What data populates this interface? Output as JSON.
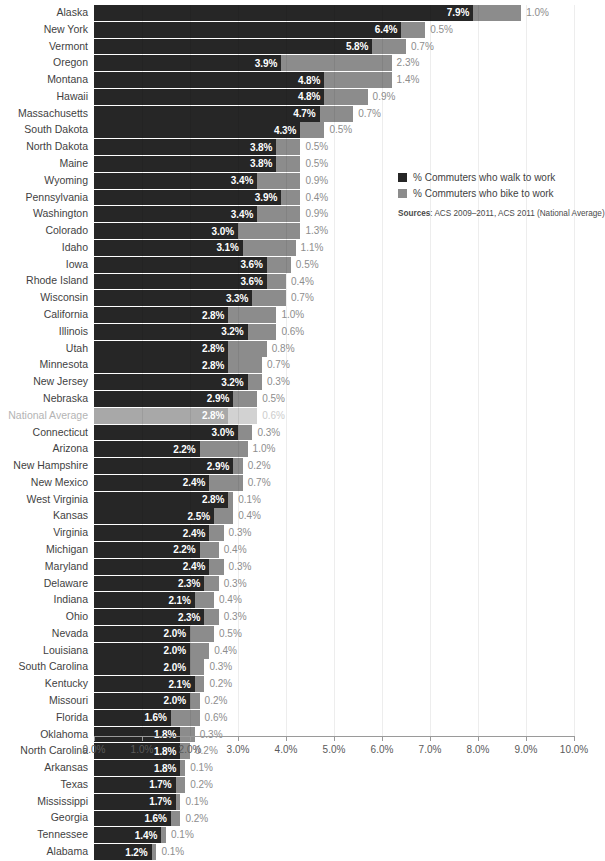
{
  "chart_data": {
    "type": "bar",
    "orientation": "horizontal",
    "stacked": true,
    "title": "",
    "subtitle": "",
    "xlabel": "",
    "ylabel": "",
    "xlim": [
      0,
      10
    ],
    "xtick_labels": [
      "0.0%",
      "1.0%",
      "2.0%",
      "3.0%",
      "4.0%",
      "5.0%",
      "6.0%",
      "7.0%",
      "8.0%",
      "9.0%",
      "10.0%"
    ],
    "xtick_values": [
      0,
      1,
      2,
      3,
      4,
      5,
      6,
      7,
      8,
      9,
      10
    ],
    "grid": true,
    "legend_position": "right",
    "series": [
      {
        "name": "% Commuters who walk to work",
        "color": "#262626"
      },
      {
        "name": "% Commuters who bike to work",
        "color": "#8c8c8c"
      }
    ],
    "categories": [
      "Alaska",
      "New York",
      "Vermont",
      "Oregon",
      "Montana",
      "Hawaii",
      "Massachusetts",
      "South Dakota",
      "North Dakota",
      "Maine",
      "Wyoming",
      "Pennsylvania",
      "Washington",
      "Colorado",
      "Idaho",
      "Iowa",
      "Rhode Island",
      "Wisconsin",
      "California",
      "Illinois",
      "Utah",
      "Minnesota",
      "New Jersey",
      "Nebraska",
      "National Average",
      "Connecticut",
      "Arizona",
      "New Hampshire",
      "New Mexico",
      "West Virginia",
      "Kansas",
      "Virginia",
      "Michigan",
      "Maryland",
      "Delaware",
      "Indiana",
      "Ohio",
      "Nevada",
      "Louisiana",
      "South Carolina",
      "Kentucky",
      "Missouri",
      "Florida",
      "Oklahoma",
      "North Carolina",
      "Arkansas",
      "Texas",
      "Mississippi",
      "Georgia",
      "Tennessee",
      "Alabama"
    ],
    "walk_values": [
      7.9,
      6.4,
      5.8,
      3.9,
      4.8,
      4.8,
      4.7,
      4.3,
      3.8,
      3.8,
      3.4,
      3.9,
      3.4,
      3.0,
      3.1,
      3.6,
      3.6,
      3.3,
      2.8,
      3.2,
      2.8,
      2.8,
      3.2,
      2.9,
      2.8,
      3.0,
      2.2,
      2.9,
      2.4,
      2.8,
      2.5,
      2.4,
      2.2,
      2.4,
      2.3,
      2.1,
      2.3,
      2.0,
      2.0,
      2.0,
      2.1,
      2.0,
      1.6,
      1.8,
      1.8,
      1.8,
      1.7,
      1.7,
      1.6,
      1.4,
      1.2
    ],
    "bike_values": [
      1.0,
      0.5,
      0.7,
      2.3,
      1.4,
      0.9,
      0.7,
      0.5,
      0.5,
      0.5,
      0.9,
      0.4,
      0.9,
      1.3,
      1.1,
      0.5,
      0.4,
      0.7,
      1.0,
      0.6,
      0.8,
      0.7,
      0.3,
      0.5,
      0.6,
      0.3,
      1.0,
      0.2,
      0.7,
      0.1,
      0.4,
      0.3,
      0.4,
      0.3,
      0.3,
      0.4,
      0.3,
      0.5,
      0.4,
      0.3,
      0.2,
      0.2,
      0.6,
      0.3,
      0.2,
      0.1,
      0.2,
      0.1,
      0.2,
      0.1,
      0.1
    ],
    "highlight_row": "National Average"
  },
  "rows": [
    {
      "label": "Alaska",
      "walk": "7.9%",
      "bike": "1.0%",
      "walk_v": 7.9,
      "bike_v": 1.0,
      "avg": false
    },
    {
      "label": "New York",
      "walk": "6.4%",
      "bike": "0.5%",
      "walk_v": 6.4,
      "bike_v": 0.5,
      "avg": false
    },
    {
      "label": "Vermont",
      "walk": "5.8%",
      "bike": "0.7%",
      "walk_v": 5.8,
      "bike_v": 0.7,
      "avg": false
    },
    {
      "label": "Oregon",
      "walk": "3.9%",
      "bike": "2.3%",
      "walk_v": 3.9,
      "bike_v": 2.3,
      "avg": false
    },
    {
      "label": "Montana",
      "walk": "4.8%",
      "bike": "1.4%",
      "walk_v": 4.8,
      "bike_v": 1.4,
      "avg": false
    },
    {
      "label": "Hawaii",
      "walk": "4.8%",
      "bike": "0.9%",
      "walk_v": 4.8,
      "bike_v": 0.9,
      "avg": false
    },
    {
      "label": "Massachusetts",
      "walk": "4.7%",
      "bike": "0.7%",
      "walk_v": 4.7,
      "bike_v": 0.7,
      "avg": false
    },
    {
      "label": "South Dakota",
      "walk": "4.3%",
      "bike": "0.5%",
      "walk_v": 4.3,
      "bike_v": 0.5,
      "avg": false
    },
    {
      "label": "North Dakota",
      "walk": "3.8%",
      "bike": "0.5%",
      "walk_v": 3.8,
      "bike_v": 0.5,
      "avg": false
    },
    {
      "label": "Maine",
      "walk": "3.8%",
      "bike": "0.5%",
      "walk_v": 3.8,
      "bike_v": 0.5,
      "avg": false
    },
    {
      "label": "Wyoming",
      "walk": "3.4%",
      "bike": "0.9%",
      "walk_v": 3.4,
      "bike_v": 0.9,
      "avg": false
    },
    {
      "label": "Pennsylvania",
      "walk": "3.9%",
      "bike": "0.4%",
      "walk_v": 3.9,
      "bike_v": 0.4,
      "avg": false
    },
    {
      "label": "Washington",
      "walk": "3.4%",
      "bike": "0.9%",
      "walk_v": 3.4,
      "bike_v": 0.9,
      "avg": false
    },
    {
      "label": "Colorado",
      "walk": "3.0%",
      "bike": "1.3%",
      "walk_v": 3.0,
      "bike_v": 1.3,
      "avg": false
    },
    {
      "label": "Idaho",
      "walk": "3.1%",
      "bike": "1.1%",
      "walk_v": 3.1,
      "bike_v": 1.1,
      "avg": false
    },
    {
      "label": "Iowa",
      "walk": "3.6%",
      "bike": "0.5%",
      "walk_v": 3.6,
      "bike_v": 0.5,
      "avg": false
    },
    {
      "label": "Rhode Island",
      "walk": "3.6%",
      "bike": "0.4%",
      "walk_v": 3.6,
      "bike_v": 0.4,
      "avg": false
    },
    {
      "label": "Wisconsin",
      "walk": "3.3%",
      "bike": "0.7%",
      "walk_v": 3.3,
      "bike_v": 0.7,
      "avg": false
    },
    {
      "label": "California",
      "walk": "2.8%",
      "bike": "1.0%",
      "walk_v": 2.8,
      "bike_v": 1.0,
      "avg": false
    },
    {
      "label": "Illinois",
      "walk": "3.2%",
      "bike": "0.6%",
      "walk_v": 3.2,
      "bike_v": 0.6,
      "avg": false
    },
    {
      "label": "Utah",
      "walk": "2.8%",
      "bike": "0.8%",
      "walk_v": 2.8,
      "bike_v": 0.8,
      "avg": false
    },
    {
      "label": "Minnesota",
      "walk": "2.8%",
      "bike": "0.7%",
      "walk_v": 2.8,
      "bike_v": 0.7,
      "avg": false
    },
    {
      "label": "New Jersey",
      "walk": "3.2%",
      "bike": "0.3%",
      "walk_v": 3.2,
      "bike_v": 0.3,
      "avg": false
    },
    {
      "label": "Nebraska",
      "walk": "2.9%",
      "bike": "0.5%",
      "walk_v": 2.9,
      "bike_v": 0.5,
      "avg": false
    },
    {
      "label": "National Average",
      "walk": "2.8%",
      "bike": "0.6%",
      "walk_v": 2.8,
      "bike_v": 0.6,
      "avg": true
    },
    {
      "label": "Connecticut",
      "walk": "3.0%",
      "bike": "0.3%",
      "walk_v": 3.0,
      "bike_v": 0.3,
      "avg": false
    },
    {
      "label": "Arizona",
      "walk": "2.2%",
      "bike": "1.0%",
      "walk_v": 2.2,
      "bike_v": 1.0,
      "avg": false
    },
    {
      "label": "New Hampshire",
      "walk": "2.9%",
      "bike": "0.2%",
      "walk_v": 2.9,
      "bike_v": 0.2,
      "avg": false
    },
    {
      "label": "New Mexico",
      "walk": "2.4%",
      "bike": "0.7%",
      "walk_v": 2.4,
      "bike_v": 0.7,
      "avg": false
    },
    {
      "label": "West Virginia",
      "walk": "2.8%",
      "bike": "0.1%",
      "walk_v": 2.8,
      "bike_v": 0.1,
      "avg": false
    },
    {
      "label": "Kansas",
      "walk": "2.5%",
      "bike": "0.4%",
      "walk_v": 2.5,
      "bike_v": 0.4,
      "avg": false
    },
    {
      "label": "Virginia",
      "walk": "2.4%",
      "bike": "0.3%",
      "walk_v": 2.4,
      "bike_v": 0.3,
      "avg": false
    },
    {
      "label": "Michigan",
      "walk": "2.2%",
      "bike": "0.4%",
      "walk_v": 2.2,
      "bike_v": 0.4,
      "avg": false
    },
    {
      "label": "Maryland",
      "walk": "2.4%",
      "bike": "0.3%",
      "walk_v": 2.4,
      "bike_v": 0.3,
      "avg": false
    },
    {
      "label": "Delaware",
      "walk": "2.3%",
      "bike": "0.3%",
      "walk_v": 2.3,
      "bike_v": 0.3,
      "avg": false
    },
    {
      "label": "Indiana",
      "walk": "2.1%",
      "bike": "0.4%",
      "walk_v": 2.1,
      "bike_v": 0.4,
      "avg": false
    },
    {
      "label": "Ohio",
      "walk": "2.3%",
      "bike": "0.3%",
      "walk_v": 2.3,
      "bike_v": 0.3,
      "avg": false
    },
    {
      "label": "Nevada",
      "walk": "2.0%",
      "bike": "0.5%",
      "walk_v": 2.0,
      "bike_v": 0.5,
      "avg": false
    },
    {
      "label": "Louisiana",
      "walk": "2.0%",
      "bike": "0.4%",
      "walk_v": 2.0,
      "bike_v": 0.4,
      "avg": false
    },
    {
      "label": "South Carolina",
      "walk": "2.0%",
      "bike": "0.3%",
      "walk_v": 2.0,
      "bike_v": 0.3,
      "avg": false
    },
    {
      "label": "Kentucky",
      "walk": "2.1%",
      "bike": "0.2%",
      "walk_v": 2.1,
      "bike_v": 0.2,
      "avg": false
    },
    {
      "label": "Missouri",
      "walk": "2.0%",
      "bike": "0.2%",
      "walk_v": 2.0,
      "bike_v": 0.2,
      "avg": false
    },
    {
      "label": "Florida",
      "walk": "1.6%",
      "bike": "0.6%",
      "walk_v": 1.6,
      "bike_v": 0.6,
      "avg": false
    },
    {
      "label": "Oklahoma",
      "walk": "1.8%",
      "bike": "0.3%",
      "walk_v": 1.8,
      "bike_v": 0.3,
      "avg": false
    },
    {
      "label": "North Carolina",
      "walk": "1.8%",
      "bike": "0.2%",
      "walk_v": 1.8,
      "bike_v": 0.2,
      "avg": false
    },
    {
      "label": "Arkansas",
      "walk": "1.8%",
      "bike": "0.1%",
      "walk_v": 1.8,
      "bike_v": 0.1,
      "avg": false
    },
    {
      "label": "Texas",
      "walk": "1.7%",
      "bike": "0.2%",
      "walk_v": 1.7,
      "bike_v": 0.2,
      "avg": false
    },
    {
      "label": "Mississippi",
      "walk": "1.7%",
      "bike": "0.1%",
      "walk_v": 1.7,
      "bike_v": 0.1,
      "avg": false
    },
    {
      "label": "Georgia",
      "walk": "1.6%",
      "bike": "0.2%",
      "walk_v": 1.6,
      "bike_v": 0.2,
      "avg": false
    },
    {
      "label": "Tennessee",
      "walk": "1.4%",
      "bike": "0.1%",
      "walk_v": 1.4,
      "bike_v": 0.1,
      "avg": false
    },
    {
      "label": "Alabama",
      "walk": "1.2%",
      "bike": "0.1%",
      "walk_v": 1.2,
      "bike_v": 0.1,
      "avg": false
    }
  ],
  "axis": {
    "ticks": [
      "0.0%",
      "1.0%",
      "2.0%",
      "3.0%",
      "4.0%",
      "5.0%",
      "6.0%",
      "7.0%",
      "8.0%",
      "9.0%",
      "10.0%"
    ],
    "tick_values": [
      0,
      1,
      2,
      3,
      4,
      5,
      6,
      7,
      8,
      9,
      10
    ],
    "max": 10
  },
  "legend": {
    "items": [
      {
        "label": "% Commuters who walk to work",
        "color": "#262626",
        "key": "walk"
      },
      {
        "label": "% Commuters who bike to work",
        "color": "#8c8c8c",
        "key": "bike"
      }
    ]
  },
  "sources": {
    "prefix": "Sources",
    "text": ": ACS 2009–2011, ACS 2011 (National Average)"
  },
  "colors": {
    "walk": "#262626",
    "bike": "#8c8c8c",
    "walk_avg": "#a8a8a8",
    "bike_avg": "#d2d2d2",
    "label": "#3f3f3f",
    "label_avg": "#b4b4b4",
    "value_bike": "#8d8d8d",
    "axis": "#9a9a9a"
  }
}
